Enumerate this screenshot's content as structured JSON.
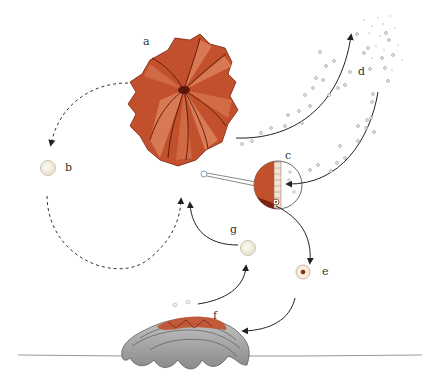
{
  "diagram": {
    "type": "life-cycle",
    "labels": [
      {
        "id": "a",
        "text": "a",
        "x": 145,
        "y": 42
      },
      {
        "id": "b",
        "text": "b",
        "x": 65,
        "y": 165
      },
      {
        "id": "c",
        "text": "c",
        "x": 285,
        "y": 152
      },
      {
        "id": "d",
        "text": "d",
        "x": 358,
        "y": 70
      },
      {
        "id": "e",
        "text": "e",
        "x": 322,
        "y": 266
      },
      {
        "id": "f",
        "text": "f",
        "x": 212,
        "y": 311
      },
      {
        "id": "g",
        "text": "g",
        "x": 230,
        "y": 226
      }
    ],
    "colors": {
      "polyp_dark": "#8a2a12",
      "polyp_mid": "#c2502c",
      "polyp_light": "#e08a62",
      "egg_fill": "#f2efe2",
      "egg_stroke": "#bdb8a4",
      "reef_fill": "#a8a8a8",
      "reef_dark": "#6e6e6e",
      "arrow": "#333333",
      "particle": "#9a9a9a",
      "ground": "#888888"
    }
  }
}
